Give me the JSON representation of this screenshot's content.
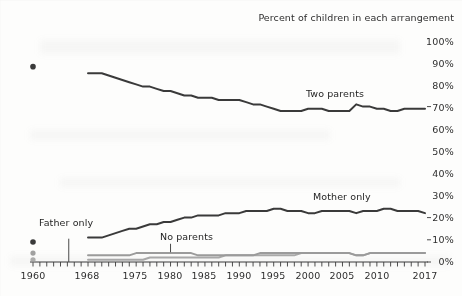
{
  "chart_data": {
    "type": "line",
    "title": "Percent of children in each arrangement",
    "xlabel": "",
    "ylabel": "",
    "ylim": [
      0,
      100
    ],
    "xlim": [
      1960,
      2017
    ],
    "grid": false,
    "legend_position": "inline-annotations",
    "y_ticks": [
      "0%",
      "10%",
      "20%",
      "30%",
      "40%",
      "50%",
      "60%",
      "70%",
      "80%",
      "90%",
      "100%"
    ],
    "y_tick_values": [
      0,
      10,
      20,
      30,
      40,
      50,
      60,
      70,
      80,
      90,
      100
    ],
    "x_ticks": [
      "1960",
      "1968",
      "1975",
      "1980",
      "1985",
      "1990",
      "1995",
      "2000",
      "2005",
      "2010",
      "2017"
    ],
    "x_tick_values": [
      1960,
      1968,
      1975,
      1980,
      1985,
      1990,
      1995,
      2000,
      2005,
      2010,
      2017
    ],
    "note": "Isolated markers plotted at 1960; continuous series begin at 1968.",
    "series": [
      {
        "name": "Two parents",
        "color": "#3a3a3a",
        "marker_1960": {
          "x": 1960,
          "y": 88
        },
        "x": [
          1968,
          1969,
          1970,
          1971,
          1972,
          1973,
          1974,
          1975,
          1976,
          1977,
          1978,
          1979,
          1980,
          1981,
          1982,
          1983,
          1984,
          1985,
          1986,
          1987,
          1988,
          1989,
          1990,
          1991,
          1992,
          1993,
          1994,
          1995,
          1996,
          1997,
          1998,
          1999,
          2000,
          2001,
          2002,
          2003,
          2004,
          2005,
          2006,
          2007,
          2008,
          2009,
          2010,
          2011,
          2012,
          2013,
          2014,
          2015,
          2016,
          2017
        ],
        "values": [
          85,
          85,
          85,
          84,
          83,
          82,
          81,
          80,
          79,
          79,
          78,
          77,
          77,
          76,
          75,
          75,
          74,
          74,
          74,
          73,
          73,
          73,
          73,
          72,
          71,
          71,
          70,
          69,
          68,
          68,
          68,
          68,
          69,
          69,
          69,
          68,
          68,
          68,
          68,
          71,
          70,
          70,
          69,
          69,
          68,
          68,
          69,
          69,
          69,
          69
        ]
      },
      {
        "name": "Mother only",
        "color": "#3a3a3a",
        "marker_1960": {
          "x": 1960,
          "y": 9
        },
        "x": [
          1968,
          1969,
          1970,
          1971,
          1972,
          1973,
          1974,
          1975,
          1976,
          1977,
          1978,
          1979,
          1980,
          1981,
          1982,
          1983,
          1984,
          1985,
          1986,
          1987,
          1988,
          1989,
          1990,
          1991,
          1992,
          1993,
          1994,
          1995,
          1996,
          1997,
          1998,
          1999,
          2000,
          2001,
          2002,
          2003,
          2004,
          2005,
          2006,
          2007,
          2008,
          2009,
          2010,
          2011,
          2012,
          2013,
          2014,
          2015,
          2016,
          2017
        ],
        "values": [
          11,
          11,
          11,
          12,
          13,
          14,
          15,
          15,
          16,
          17,
          17,
          18,
          18,
          19,
          20,
          20,
          21,
          21,
          21,
          21,
          22,
          22,
          22,
          23,
          23,
          23,
          23,
          24,
          24,
          23,
          23,
          23,
          22,
          22,
          23,
          23,
          23,
          23,
          23,
          22,
          23,
          23,
          23,
          24,
          24,
          23,
          23,
          23,
          23,
          22
        ]
      },
      {
        "name": "No parents",
        "color": "#8a8a8a",
        "marker_1960": {
          "x": 1960,
          "y": 4
        },
        "x": [
          1968,
          1969,
          1970,
          1971,
          1972,
          1973,
          1974,
          1975,
          1976,
          1977,
          1978,
          1979,
          1980,
          1981,
          1982,
          1983,
          1984,
          1985,
          1986,
          1987,
          1988,
          1989,
          1990,
          1991,
          1992,
          1993,
          1994,
          1995,
          1996,
          1997,
          1998,
          1999,
          2000,
          2001,
          2002,
          2003,
          2004,
          2005,
          2006,
          2007,
          2008,
          2009,
          2010,
          2011,
          2012,
          2013,
          2014,
          2015,
          2016,
          2017
        ],
        "values": [
          3,
          3,
          3,
          3,
          3,
          3,
          3,
          4,
          4,
          4,
          4,
          4,
          4,
          4,
          4,
          4,
          3,
          3,
          3,
          3,
          3,
          3,
          3,
          3,
          3,
          4,
          4,
          4,
          4,
          4,
          4,
          4,
          4,
          4,
          4,
          4,
          4,
          4,
          4,
          3,
          3,
          4,
          4,
          4,
          4,
          4,
          4,
          4,
          4,
          4
        ]
      },
      {
        "name": "Father only",
        "color": "#9a9a9a",
        "marker_1960": {
          "x": 1960,
          "y": 1
        },
        "x": [
          1968,
          1969,
          1970,
          1971,
          1972,
          1973,
          1974,
          1975,
          1976,
          1977,
          1978,
          1979,
          1980,
          1981,
          1982,
          1983,
          1984,
          1985,
          1986,
          1987,
          1988,
          1989,
          1990,
          1991,
          1992,
          1993,
          1994,
          1995,
          1996,
          1997,
          1998,
          1999,
          2000,
          2001,
          2002,
          2003,
          2004,
          2005,
          2006,
          2007,
          2008,
          2009,
          2010,
          2011,
          2012,
          2013,
          2014,
          2015,
          2016,
          2017
        ],
        "values": [
          1,
          1,
          1,
          1,
          1,
          1,
          1,
          1,
          1,
          2,
          2,
          2,
          2,
          2,
          2,
          2,
          2,
          2,
          2,
          2,
          3,
          3,
          3,
          3,
          3,
          3,
          3,
          3,
          3,
          3,
          3,
          4,
          4,
          4,
          4,
          4,
          4,
          4,
          4,
          3,
          3,
          4,
          4,
          4,
          4,
          4,
          4,
          4,
          4,
          4
        ]
      }
    ],
    "annotations": [
      {
        "name": "two-parents-label",
        "text": "Two parents",
        "x": 2001,
        "y": 75
      },
      {
        "name": "mother-only-label",
        "text": "Mother only",
        "x": 2003,
        "y": 28
      },
      {
        "name": "father-only-label",
        "text": "Father only",
        "x": 1964,
        "y": 12,
        "leader": true
      },
      {
        "name": "no-parents-label",
        "text": "No parents",
        "x": 1980,
        "y": 9,
        "leader": true
      }
    ]
  }
}
